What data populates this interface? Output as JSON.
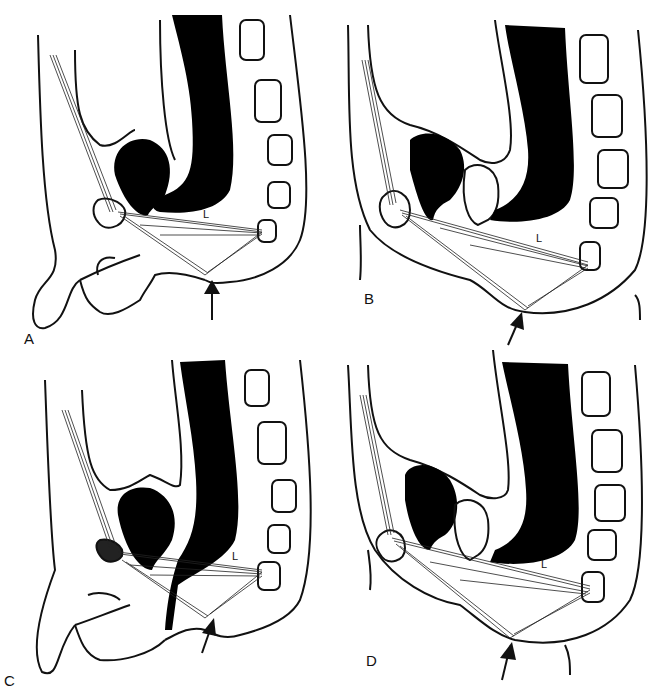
{
  "figure": {
    "panels": [
      {
        "id": "A",
        "label": "A",
        "muscle_label": "L",
        "sex": "male",
        "arrow": "perineal-body-arrow"
      },
      {
        "id": "B",
        "label": "B",
        "muscle_label": "L",
        "sex": "female",
        "arrow": "perineal-body-arrow"
      },
      {
        "id": "C",
        "label": "C",
        "muscle_label": "L",
        "sex": "male",
        "arrow": "perineal-body-arrow"
      },
      {
        "id": "D",
        "label": "D",
        "muscle_label": "L",
        "sex": "female",
        "arrow": "perineal-body-arrow"
      }
    ],
    "colors": {
      "ink": "#111111",
      "fill": "#000000",
      "background": "#ffffff"
    }
  }
}
